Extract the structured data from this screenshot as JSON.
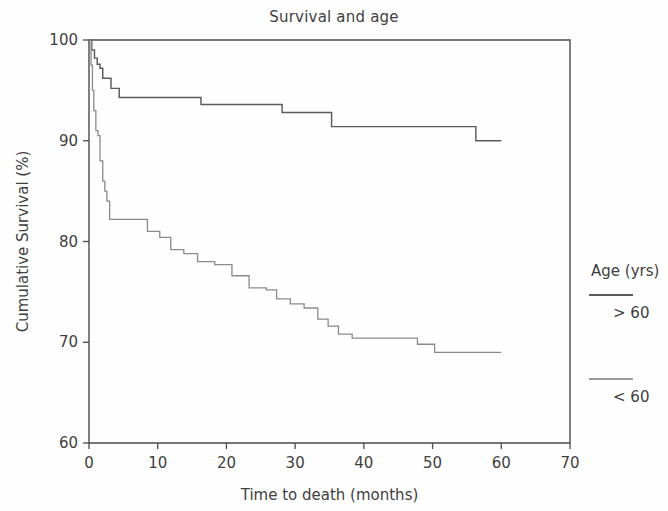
{
  "chart_data": {
    "type": "line",
    "title": "Survival and age",
    "xlabel": "Time to death (months)",
    "ylabel": "Cumulative Survival (%)",
    "xlim": [
      0,
      70
    ],
    "ylim": [
      60,
      100
    ],
    "xticks": [
      0,
      10,
      20,
      30,
      40,
      50,
      60,
      70
    ],
    "yticks": [
      60,
      70,
      80,
      90,
      100
    ],
    "grid": false,
    "legend_position": "right",
    "legend_title": "Age (yrs)",
    "series": [
      {
        "name": "> 60",
        "style": "step",
        "color": "#5b5b5b",
        "points": [
          [
            0,
            100.0
          ],
          [
            0.4,
            99.0
          ],
          [
            0.8,
            98.2
          ],
          [
            1.2,
            97.6
          ],
          [
            1.6,
            97.2
          ],
          [
            2.0,
            96.2
          ],
          [
            3.0,
            96.2
          ],
          [
            3.2,
            95.2
          ],
          [
            4.2,
            95.2
          ],
          [
            4.4,
            94.3
          ],
          [
            16.0,
            94.3
          ],
          [
            16.3,
            93.6
          ],
          [
            27.8,
            93.6
          ],
          [
            28.1,
            92.8
          ],
          [
            35.0,
            92.8
          ],
          [
            35.3,
            91.4
          ],
          [
            56.0,
            91.4
          ],
          [
            56.3,
            90.0
          ],
          [
            60.0,
            90.0
          ]
        ]
      },
      {
        "name": "< 60",
        "style": "step",
        "color": "#8a8a8a",
        "points": [
          [
            0,
            100.0
          ],
          [
            0.3,
            97.5
          ],
          [
            0.5,
            95.0
          ],
          [
            0.7,
            93.0
          ],
          [
            1.0,
            91.0
          ],
          [
            1.3,
            90.5
          ],
          [
            1.6,
            88.0
          ],
          [
            2.0,
            86.0
          ],
          [
            2.3,
            85.0
          ],
          [
            2.6,
            84.0
          ],
          [
            3.0,
            82.2
          ],
          [
            8.2,
            82.2
          ],
          [
            8.5,
            81.0
          ],
          [
            10.0,
            81.0
          ],
          [
            10.3,
            80.4
          ],
          [
            11.6,
            80.4
          ],
          [
            11.9,
            79.2
          ],
          [
            13.5,
            79.2
          ],
          [
            13.8,
            78.8
          ],
          [
            15.5,
            78.8
          ],
          [
            15.8,
            78.0
          ],
          [
            18.0,
            78.0
          ],
          [
            18.3,
            77.7
          ],
          [
            20.5,
            77.7
          ],
          [
            20.8,
            76.6
          ],
          [
            23.0,
            76.6
          ],
          [
            23.3,
            75.4
          ],
          [
            25.5,
            75.4
          ],
          [
            25.8,
            75.2
          ],
          [
            27.0,
            75.2
          ],
          [
            27.3,
            74.3
          ],
          [
            29.0,
            74.3
          ],
          [
            29.3,
            73.8
          ],
          [
            31.0,
            73.8
          ],
          [
            31.3,
            73.4
          ],
          [
            33.0,
            73.4
          ],
          [
            33.3,
            72.3
          ],
          [
            34.5,
            72.3
          ],
          [
            34.8,
            71.6
          ],
          [
            36.0,
            71.6
          ],
          [
            36.3,
            70.8
          ],
          [
            38.0,
            70.8
          ],
          [
            38.3,
            70.4
          ],
          [
            47.5,
            70.4
          ],
          [
            47.8,
            69.8
          ],
          [
            50.0,
            69.8
          ],
          [
            50.3,
            69.0
          ],
          [
            60.0,
            69.0
          ]
        ]
      }
    ]
  },
  "legend": {
    "title": "Age (yrs)",
    "entries": [
      {
        "label": "> 60"
      },
      {
        "label": "< 60"
      }
    ]
  }
}
